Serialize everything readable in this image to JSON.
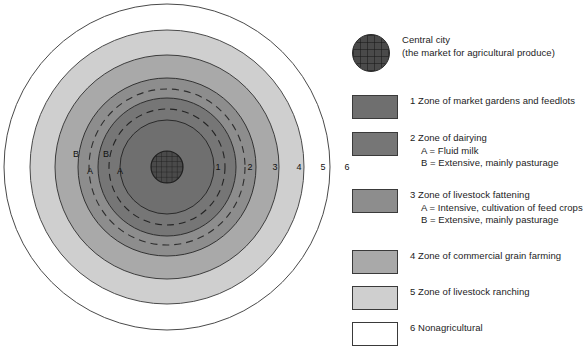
{
  "diagram": {
    "name": "von-thunen-concentric-land-use-model",
    "center_label_icon": "city-grid-icon",
    "ring_labels": [
      {
        "id": "ring-label-1",
        "text": "1",
        "x": 218,
        "y": 170
      },
      {
        "id": "ring-label-2",
        "text": "2",
        "x": 250,
        "y": 170
      },
      {
        "id": "ring-label-3",
        "text": "3",
        "x": 275,
        "y": 170
      },
      {
        "id": "ring-label-4",
        "text": "4",
        "x": 299,
        "y": 170
      },
      {
        "id": "ring-label-5",
        "text": "5",
        "x": 323,
        "y": 170
      },
      {
        "id": "ring-label-6",
        "text": "6",
        "x": 347,
        "y": 170
      }
    ],
    "sub_labels": [
      {
        "id": "sublabel-zone3-B",
        "text": "B",
        "x": 76,
        "y": 157
      },
      {
        "id": "sublabel-zone3-A",
        "text": "A",
        "x": 90,
        "y": 174
      },
      {
        "id": "sublabel-zone2-B",
        "text": "B",
        "x": 106,
        "y": 157
      },
      {
        "id": "sublabel-zone2-A",
        "text": "A",
        "x": 120,
        "y": 174
      }
    ],
    "colors": {
      "central_city": "#4a4a4a",
      "zone1": "#6f6f6f",
      "zone2": "#767676",
      "zone3": "#8d8d8d",
      "zone4": "#a9a9a9",
      "zone5": "#cfcfcf",
      "zone6": "#ffffff",
      "outline": "#333333"
    },
    "geometry": {
      "cx": 167,
      "cy": 167,
      "r_city": 16,
      "r_zone1": 47,
      "r_zone2_A": 58,
      "r_zone2": 69,
      "r_zone3_A": 78,
      "r_zone3": 89,
      "r_zone4": 112,
      "r_zone5": 137,
      "r_zone6": 163
    }
  },
  "legend": {
    "items": [
      {
        "id": "legend-central-city",
        "swatch": "circle",
        "color": "#4a4a4a",
        "title": "Central city",
        "lines": [
          "(the market for agricultural produce)"
        ],
        "top": 0
      },
      {
        "id": "legend-zone-1",
        "swatch": "rect",
        "color": "#6f6f6f",
        "title": "1 Zone of market gardens and feedlots",
        "lines": [],
        "top": 61
      },
      {
        "id": "legend-zone-2",
        "swatch": "rect",
        "color": "#767676",
        "title": "2 Zone of dairying",
        "lines": [
          "A = Fluid milk",
          "B = Extensive, mainly pasturage"
        ],
        "top": 98
      },
      {
        "id": "legend-zone-3",
        "swatch": "rect",
        "color": "#8d8d8d",
        "title": "3 Zone of livestock fattening",
        "lines": [
          "A = Intensive, cultivation of feed crops",
          "B = Extensive, mainly pasturage"
        ],
        "top": 155
      },
      {
        "id": "legend-zone-4",
        "swatch": "rect",
        "color": "#a9a9a9",
        "title": "4 Zone of commercial grain farming",
        "lines": [],
        "top": 216
      },
      {
        "id": "legend-zone-5",
        "swatch": "rect",
        "color": "#cfcfcf",
        "title": "5 Zone of livestock ranching",
        "lines": [],
        "top": 252
      },
      {
        "id": "legend-zone-6",
        "swatch": "rect",
        "color": "#ffffff",
        "title": "6 Nonagricultural",
        "lines": [],
        "top": 288
      }
    ]
  }
}
